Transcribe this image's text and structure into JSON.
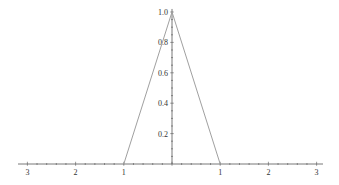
{
  "chart_data": {
    "type": "line",
    "title": "",
    "xlabel": "",
    "ylabel": "",
    "xlim": [
      -3.1,
      3.1
    ],
    "ylim": [
      0,
      1.0
    ],
    "grid": false,
    "legend": null,
    "x_tick_labels": [
      "3",
      "2",
      "1",
      "1",
      "2",
      "3"
    ],
    "x_tick_values": [
      -3,
      -2,
      -1,
      1,
      2,
      3
    ],
    "y_tick_labels": [
      "0.2",
      "0.4",
      "0.6",
      "0.8",
      "1.0"
    ],
    "y_tick_values": [
      0.2,
      0.4,
      0.6,
      0.8,
      1.0
    ],
    "series": [
      {
        "name": "triangle",
        "x": [
          -1,
          0,
          1
        ],
        "y": [
          0,
          1,
          0
        ],
        "color": "#a0a0a0"
      }
    ]
  },
  "style": {
    "axis_color": "#555555",
    "line_color": "#a0a0a0"
  }
}
